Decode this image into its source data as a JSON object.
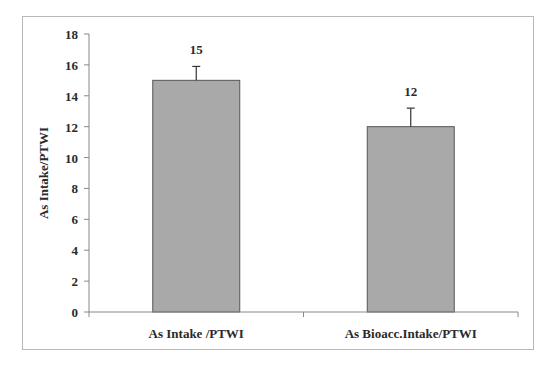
{
  "chart_data": {
    "type": "bar",
    "title": "",
    "xlabel": "",
    "ylabel": "As Intake/PTWI",
    "categories": [
      "As Intake /PTWI",
      "As Bioacc.Intake/PTWI"
    ],
    "values": [
      15,
      12
    ],
    "error_bars": [
      0.9,
      1.2
    ],
    "data_labels": [
      "15",
      "12"
    ],
    "ylim": [
      0,
      18
    ],
    "yticks": [
      0,
      2,
      4,
      6,
      8,
      10,
      12,
      14,
      16,
      18
    ],
    "grid": false,
    "legend": null,
    "bar_color": "#a9a9a9",
    "bar_edge_color": "#555555"
  }
}
